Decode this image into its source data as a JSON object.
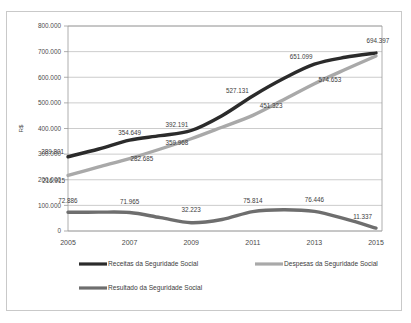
{
  "chart_data": {
    "type": "line",
    "title": "",
    "xlabel": "",
    "ylabel": "R$",
    "ylim": [
      0,
      800000
    ],
    "ytick_step": 100000,
    "grid": true,
    "legend_position": "bottom",
    "x": [
      2005,
      2006,
      2007,
      2008,
      2009,
      2010,
      2011,
      2012,
      2013,
      2014,
      2015
    ],
    "categories": [
      "2005",
      "2006",
      "2007",
      "2008",
      "2009",
      "2010",
      "2011",
      "2012",
      "2013",
      "2014",
      "2015"
    ],
    "xtick_labels": [
      "2005",
      "2007",
      "2009",
      "2011",
      "2013",
      "2015"
    ],
    "ytick_labels": [
      "0",
      "100.000",
      "200.000",
      "300.000",
      "400.000",
      "500.000",
      "600.000",
      "700.000",
      "800.000"
    ],
    "ytick_values": [
      0,
      100000,
      200000,
      300000,
      400000,
      500000,
      600000,
      700000,
      800000
    ],
    "series": [
      {
        "name": "Receitas da Seguridade Social",
        "color": "#2b2b2b",
        "values": [
          289801,
          320000,
          354649,
          372000,
          392191,
          450000,
          527131,
          595000,
          651099,
          678000,
          694397
        ],
        "labels": [
          {
            "x": 2005,
            "value": 289801,
            "text": "289.801"
          },
          {
            "x": 2007,
            "value": 354649,
            "text": "354.649"
          },
          {
            "x": 2009,
            "value": 392191,
            "text": "392.191"
          },
          {
            "x": 2011,
            "value": 527131,
            "text": "527.131"
          },
          {
            "x": 2013,
            "value": 651099,
            "text": "651.099"
          },
          {
            "x": 2015,
            "value": 694397,
            "text": "694.397"
          }
        ]
      },
      {
        "name": "Despesas da Seguridade Social",
        "color": "#a9a9a9",
        "values": [
          216915,
          250000,
          282685,
          320000,
          359968,
          405000,
          451323,
          512000,
          574653,
          630000,
          683060
        ],
        "labels": [
          {
            "x": 2005,
            "value": 216915,
            "text": "216.915"
          },
          {
            "x": 2007,
            "value": 282685,
            "text": "282.685"
          },
          {
            "x": 2009,
            "value": 359968,
            "text": "359.968"
          },
          {
            "x": 2011,
            "value": 451323,
            "text": "451.323"
          },
          {
            "x": 2013,
            "value": 574653,
            "text": "574.653"
          }
        ]
      },
      {
        "name": "Resultado da Seguridade Social",
        "color": "#6e6e6e",
        "values": [
          72886,
          73500,
          71965,
          52000,
          32223,
          45000,
          75814,
          83000,
          76446,
          47000,
          11337
        ],
        "labels": [
          {
            "x": 2005,
            "value": 72886,
            "text": "72.886"
          },
          {
            "x": 2007,
            "value": 71965,
            "text": "71.965"
          },
          {
            "x": 2009,
            "value": 32223,
            "text": "32.223"
          },
          {
            "x": 2011,
            "value": 75814,
            "text": "75.814"
          },
          {
            "x": 2013,
            "value": 76446,
            "text": "76.446"
          },
          {
            "x": 2015,
            "value": 11337,
            "text": "11.337"
          }
        ]
      }
    ],
    "legend": [
      {
        "label": "Receitas da Seguridade Social",
        "color": "#2b2b2b"
      },
      {
        "label": "Despesas da Seguridade Social",
        "color": "#a9a9a9"
      },
      {
        "label": "Resultado da Seguridade Social",
        "color": "#6e6e6e"
      }
    ]
  }
}
